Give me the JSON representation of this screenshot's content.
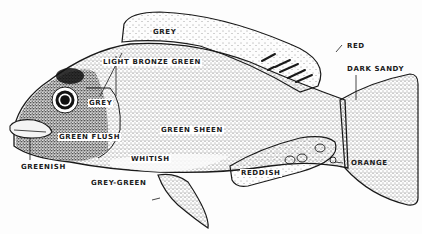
{
  "diagram": {
    "labels": {
      "grey_dorsal": "GREY",
      "red": "RED",
      "light_bronze_green": "LIGHT BRONZE GREEN",
      "dark_sandy": "DARK SANDY",
      "grey_operculum": "GREY",
      "green_flush": "GREEN FLUSH",
      "green_sheen": "GREEN SHEEN",
      "greenish": "GREENISH",
      "whitish": "WHITISH",
      "grey_green": "GREY-GREEN",
      "reddish": "REDDISH",
      "orange": "ORANGE"
    },
    "colors": {
      "ink": "#1a1a1a",
      "paper": "#fdfdfd"
    }
  }
}
